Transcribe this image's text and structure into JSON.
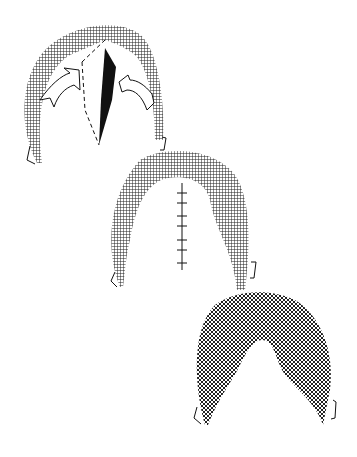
{
  "figure": {
    "type": "surgical-illustration",
    "stages": [
      {
        "name": "stage-1-incision-and-advancement",
        "elements": [
          "hatched-crescent",
          "dashed-incision-line",
          "black-wedge-defect",
          "left-arrow",
          "right-arrow",
          "left-ear",
          "right-ear"
        ]
      },
      {
        "name": "stage-2-sutured-closure",
        "elements": [
          "hatched-crescent",
          "suture-line",
          "left-ear",
          "right-ear"
        ]
      },
      {
        "name": "stage-3-healed-result",
        "elements": [
          "crosshatched-horseshoe",
          "left-ear",
          "right-ear"
        ]
      }
    ],
    "colors": {
      "ink": "#111111",
      "background": "#ffffff"
    }
  }
}
